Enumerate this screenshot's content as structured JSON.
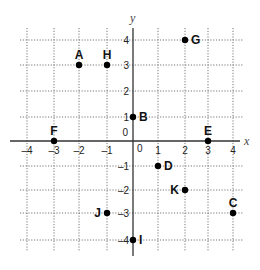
{
  "chart_data": {
    "type": "scatter",
    "title": "",
    "xlabel": "x",
    "ylabel": "y",
    "xlim": [
      -4,
      4
    ],
    "ylim": [
      -4,
      4
    ],
    "grid": true,
    "grid_style": "dotted",
    "origin_label": "0",
    "x_ticks": [
      -4,
      -3,
      -2,
      -1,
      1,
      2,
      3,
      4
    ],
    "y_ticks": [
      4,
      3,
      2,
      1,
      -1,
      -2,
      -3,
      -4
    ],
    "x_tick_labels": [
      "–4",
      "–3",
      "–2",
      "–1",
      "1",
      "2",
      "3",
      "4"
    ],
    "y_tick_labels": [
      "4",
      "3",
      "2",
      "1",
      "–1",
      "–2",
      "–3",
      "–4"
    ],
    "points": [
      {
        "label": "A",
        "x": -2,
        "y": 3,
        "label_pos": "above"
      },
      {
        "label": "H",
        "x": -1,
        "y": 3,
        "label_pos": "above"
      },
      {
        "label": "G",
        "x": 2,
        "y": 4,
        "label_pos": "right"
      },
      {
        "label": "B",
        "x": 0,
        "y": 1,
        "label_pos": "right"
      },
      {
        "label": "F",
        "x": -3,
        "y": 0,
        "label_pos": "above"
      },
      {
        "label": "E",
        "x": 3,
        "y": 0,
        "label_pos": "above"
      },
      {
        "label": "D",
        "x": 1,
        "y": -1,
        "label_pos": "right"
      },
      {
        "label": "K",
        "x": 2,
        "y": -2,
        "label_pos": "left"
      },
      {
        "label": "J",
        "x": -1,
        "y": -3,
        "label_pos": "left"
      },
      {
        "label": "C",
        "x": 4,
        "y": -3,
        "label_pos": "above"
      },
      {
        "label": "I",
        "x": 0,
        "y": -4,
        "label_pos": "right"
      }
    ]
  },
  "colors": {
    "axis": "#333333",
    "grid": "#777777",
    "point": "#000000",
    "text": "#111111"
  }
}
